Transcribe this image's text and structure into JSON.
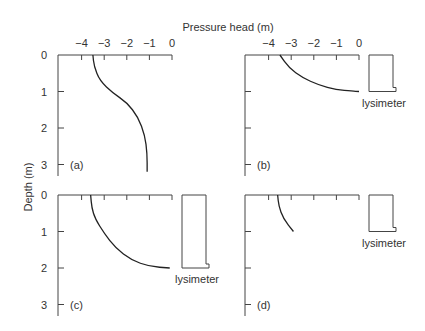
{
  "figure": {
    "x_axis_title": "Pressure head (m)",
    "y_axis_title": "Depth (m)",
    "x_ticks": [
      "−4",
      "−3",
      "−2",
      "−1",
      "0"
    ],
    "y_ticks": [
      "0",
      "1",
      "2",
      "3"
    ],
    "lysimeter_label": "lysimeter"
  },
  "panels": [
    {
      "id": "a",
      "label": "(a)",
      "has_lysimeter": false,
      "show_x_tick_labels": true,
      "show_y_tick_labels": true,
      "curve": [
        [
          -3.5,
          0
        ],
        [
          -3.45,
          0.3
        ],
        [
          -3.2,
          0.7
        ],
        [
          -2.6,
          1.05
        ],
        [
          -2.0,
          1.3
        ],
        [
          -1.5,
          1.7
        ],
        [
          -1.2,
          2.2
        ],
        [
          -1.1,
          2.7
        ],
        [
          -1.1,
          3.2
        ]
      ]
    },
    {
      "id": "b",
      "label": "(b)",
      "has_lysimeter": true,
      "lysimeter_depth": 1.0,
      "show_x_tick_labels": true,
      "show_y_tick_labels": false,
      "curve": [
        [
          -3.5,
          0
        ],
        [
          -3.1,
          0.35
        ],
        [
          -2.5,
          0.62
        ],
        [
          -1.8,
          0.82
        ],
        [
          -1.0,
          0.95
        ],
        [
          -0.3,
          0.99
        ],
        [
          0,
          1.0
        ]
      ]
    },
    {
      "id": "c",
      "label": "(c)",
      "has_lysimeter": true,
      "lysimeter_depth": 2.0,
      "show_x_tick_labels": false,
      "show_y_tick_labels": true,
      "curve": [
        [
          -3.6,
          0
        ],
        [
          -3.55,
          0.35
        ],
        [
          -3.4,
          0.65
        ],
        [
          -3.0,
          1.05
        ],
        [
          -2.5,
          1.45
        ],
        [
          -1.8,
          1.78
        ],
        [
          -1.0,
          1.96
        ],
        [
          -0.1,
          2.0
        ]
      ]
    },
    {
      "id": "d",
      "label": "(d)",
      "has_lysimeter": true,
      "lysimeter_depth": 1.0,
      "show_x_tick_labels": false,
      "show_y_tick_labels": false,
      "curve": [
        [
          -3.6,
          0
        ],
        [
          -3.55,
          0.3
        ],
        [
          -3.35,
          0.65
        ],
        [
          -2.9,
          1.0
        ]
      ]
    }
  ]
}
